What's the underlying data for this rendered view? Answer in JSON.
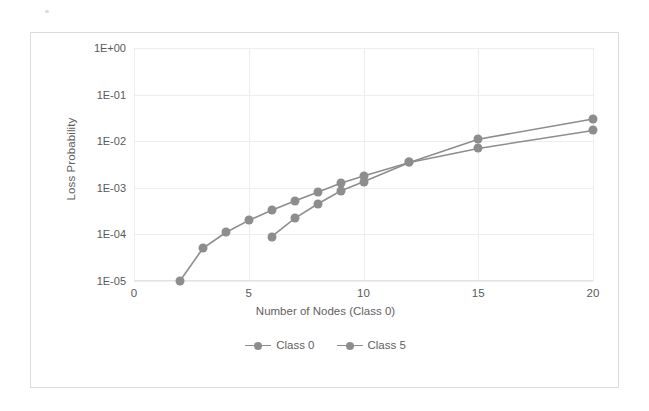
{
  "chart_data": {
    "type": "line",
    "title": "",
    "xlabel": "Number of Nodes (Class 0)",
    "ylabel": "Loss Probability",
    "yscale": "log",
    "xlim": [
      0,
      20
    ],
    "ylim": [
      1e-05,
      1
    ],
    "grid": true,
    "legend_position": "bottom",
    "xticks": [
      "0",
      "5",
      "10",
      "15",
      "20"
    ],
    "xtick_values": [
      0,
      5,
      10,
      15,
      20
    ],
    "yticks": [
      "1E+00",
      "1E-01",
      "1E-02",
      "1E-03",
      "1E-04",
      "1E-05"
    ],
    "ytick_values": [
      1,
      0.1,
      0.01,
      0.001,
      0.0001,
      1e-05
    ],
    "series": [
      {
        "name": "Class 0",
        "color": "#8d8d8d",
        "x": [
          2,
          3,
          4,
          5,
          6,
          7,
          8,
          9,
          10,
          12,
          15,
          20
        ],
        "y": [
          1e-05,
          5e-05,
          0.00011,
          0.0002,
          0.00033,
          0.00052,
          0.0008,
          0.00125,
          0.0018,
          0.0035,
          0.007,
          0.017
        ]
      },
      {
        "name": "Class 5",
        "color": "#8d8d8d",
        "x": [
          6,
          7,
          8,
          9,
          10,
          12,
          15,
          20
        ],
        "y": [
          9e-05,
          0.00022,
          0.00045,
          0.00085,
          0.00135,
          0.0035,
          0.011,
          0.03
        ]
      }
    ]
  },
  "legend": {
    "items": [
      {
        "label": "Class 0"
      },
      {
        "label": "Class 5"
      }
    ]
  },
  "axis": {
    "x_title": "Number of Nodes (Class 0)",
    "y_title": "Loss Probability"
  }
}
